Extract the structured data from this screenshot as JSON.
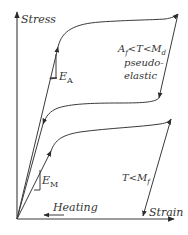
{
  "diagram": {
    "type": "stress-strain diagram (shape memory alloy)",
    "axes": {
      "y_label": "Stress",
      "x_label": "Strain"
    },
    "upper_curve": {
      "condition": "A",
      "condition_sub": "f",
      "condition_mid": "<T<M",
      "condition_sub2": "d",
      "description_line1": "pseudo-",
      "description_line2": "elastic",
      "modulus_label": "E",
      "modulus_sub": "A"
    },
    "lower_curve": {
      "condition": "T<M",
      "condition_sub": "f",
      "modulus_label": "E",
      "modulus_sub": "M"
    },
    "heating_label": "Heating",
    "colors": {
      "line": "#3a3a3a",
      "text": "#333333",
      "background": "#ffffff"
    }
  }
}
